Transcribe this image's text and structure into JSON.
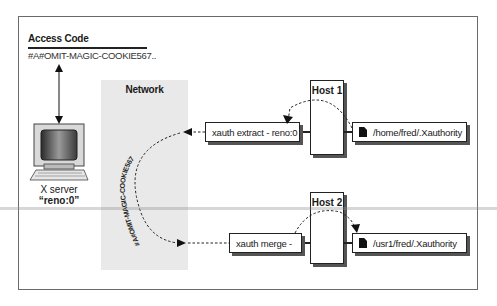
{
  "access_code": {
    "title": "Access Code",
    "value": "#A#OMIT-MAGIC-COOKIE567.."
  },
  "x_server": {
    "label": "X server",
    "display": "“reno:0”",
    "icon": "computer-monitor-icon"
  },
  "network": {
    "label": "Network",
    "cookie_text": "#A#OMIT-MAGIC-COOKIE567"
  },
  "host1": {
    "label": "Host 1",
    "command": "xauth extract - reno:0",
    "file": "/home/fred/.Xauthority",
    "file_icon": "document-icon"
  },
  "host2": {
    "label": "Host 2",
    "command": "xauth merge -",
    "file": "/usr1/fred/.Xauthority",
    "file_icon": "document-icon"
  },
  "colors": {
    "network_shade": "#e9e9e9",
    "border": "#222222",
    "shadow": "#555555"
  }
}
